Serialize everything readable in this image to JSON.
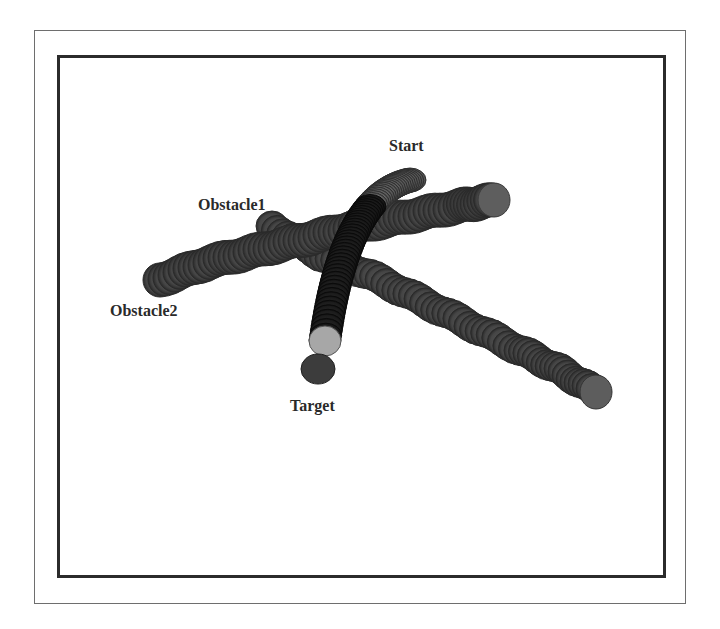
{
  "figure": {
    "labels": {
      "start": "Start",
      "obstacle1": "Obstacle1",
      "obstacle2": "Obstacle2",
      "target": "Target"
    },
    "colors": {
      "tube_dark": "#3a3a3a",
      "tube_mid": "#555555",
      "path_light": "#7a7a7a",
      "path_dark": "#1e1e1e",
      "end_disc_light": "#a9a9a9",
      "target_disc": "#3c3c3c",
      "frame_inner": "#2b2b2b",
      "frame_outer": "#6e6e6e"
    }
  }
}
